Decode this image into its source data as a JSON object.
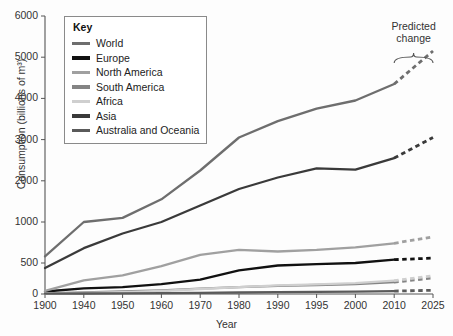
{
  "chart_data": {
    "type": "line",
    "title": "",
    "xlabel": "Year",
    "ylabel": "Consumption (billions of m³)",
    "categories": [
      "1900",
      "1940",
      "1950",
      "1960",
      "1970",
      "1980",
      "1990",
      "1995",
      "2000",
      "2010",
      "2025"
    ],
    "ytick_labels": [
      "0",
      "500",
      "1000",
      "2000",
      "3000",
      "4000",
      "5000",
      "6000"
    ],
    "ytick_values": [
      0,
      500,
      1000,
      2000,
      3000,
      4000,
      5000,
      6000
    ],
    "ylim": [
      0,
      6000
    ],
    "y_axis_note": "non-linear: 0-500-1000 compressed, 1000-6000 linear",
    "grid": false,
    "legend_position": "top-left",
    "legend_title": "Key",
    "predicted_from": "2010",
    "predicted_to": "2025",
    "annotation": "Predicted change",
    "series": [
      {
        "name": "World",
        "color": "#6e6e6e",
        "values": [
          580,
          1000,
          1100,
          1550,
          2250,
          3050,
          3450,
          3750,
          3950,
          4350,
          5150
        ]
      },
      {
        "name": "Europe",
        "color": "#111111",
        "values": [
          40,
          90,
          110,
          160,
          230,
          380,
          460,
          480,
          500,
          540,
          560
        ]
      },
      {
        "name": "North America",
        "color": "#a0a0a0",
        "values": [
          50,
          220,
          300,
          450,
          600,
          660,
          640,
          660,
          690,
          740,
          820
        ]
      },
      {
        "name": "South America",
        "color": "#848484",
        "values": [
          10,
          25,
          40,
          60,
          85,
          110,
          130,
          145,
          160,
          190,
          260
        ]
      },
      {
        "name": "Africa",
        "color": "#cfcfcf",
        "values": [
          8,
          20,
          30,
          50,
          80,
          110,
          140,
          155,
          175,
          215,
          295
        ]
      },
      {
        "name": "Asia",
        "color": "#3a3a3a",
        "values": [
          420,
          680,
          860,
          1000,
          1400,
          1800,
          2080,
          2300,
          2270,
          2550,
          3050
        ]
      },
      {
        "name": "Australia and Oceania",
        "color": "#5a5a5a",
        "values": [
          5,
          8,
          10,
          14,
          18,
          24,
          30,
          34,
          38,
          46,
          60
        ]
      }
    ]
  }
}
